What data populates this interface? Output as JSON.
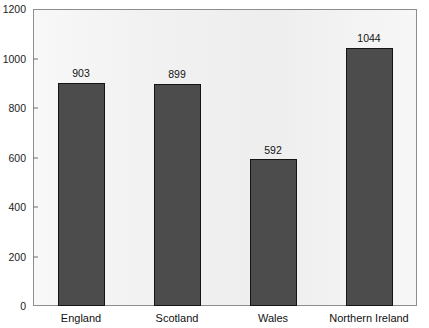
{
  "chart_data": {
    "type": "bar",
    "title": "",
    "xlabel": "",
    "ylabel": "",
    "categories": [
      "England",
      "Scotland",
      "Wales",
      "Northern Ireland"
    ],
    "values": [
      903,
      899,
      592,
      1044
    ],
    "value_labels": [
      "903",
      "899",
      "592",
      "1044"
    ],
    "ylim": [
      0,
      1200
    ],
    "yticks": [
      0,
      200,
      400,
      600,
      800,
      1000,
      1200
    ],
    "ytick_labels": [
      "0",
      "200",
      "400",
      "600",
      "800",
      "1000",
      "1200"
    ],
    "grid": false,
    "legend": null,
    "bar_color": "#4c4c4c",
    "bar_edge_color": "#141414",
    "plot_background": "#eff0ef",
    "frame_color": "#8d8d8d",
    "text_color": "#141414"
  },
  "title_remnant": ""
}
